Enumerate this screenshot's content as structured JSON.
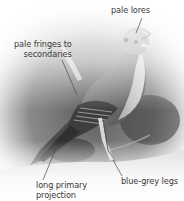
{
  "figure": {
    "style": "monochrome photograph with vignette and annotation callouts",
    "colors": {
      "background": "#ffffff",
      "label_text": "#3a3a3a",
      "leader_line": "#4a4a4a"
    }
  },
  "annotations": [
    {
      "id": "lores",
      "text": "pale lores"
    },
    {
      "id": "fringes",
      "text": "pale fringes to\nsecondaries"
    },
    {
      "id": "legs",
      "text": "blue-grey legs"
    },
    {
      "id": "projection",
      "text": "long primary\nprojection"
    }
  ]
}
